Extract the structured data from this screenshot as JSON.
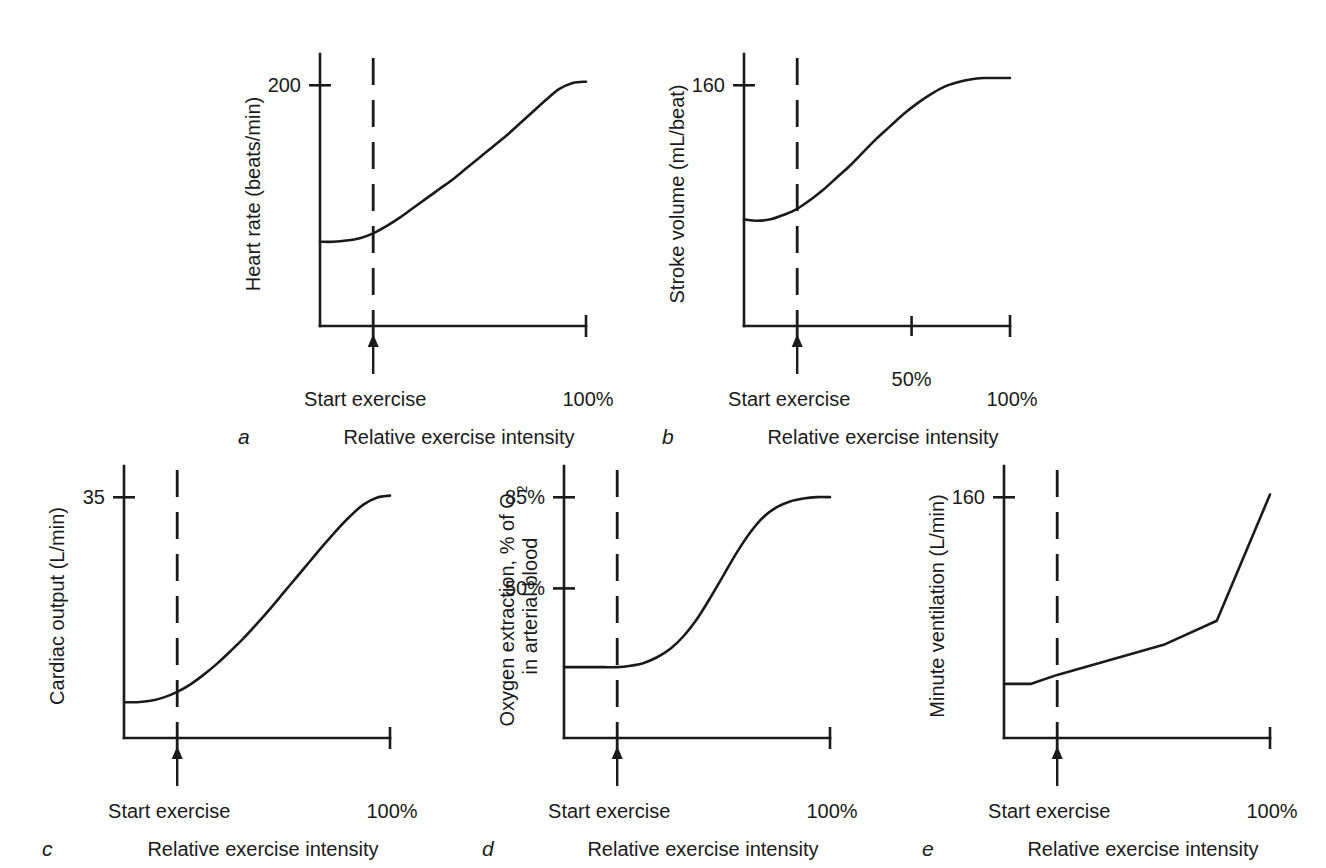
{
  "figure": {
    "background_color": "#ffffff",
    "line_color": "#1a1a1a",
    "common": {
      "xlabel": "Relative exercise intensity",
      "start_marker_label": "Start exercise",
      "x_end_label": "100%"
    }
  },
  "chart_data": [
    {
      "id": "a",
      "type": "line",
      "panel_letter": "a",
      "title": "",
      "ylabel": "Heart rate (beats/min)",
      "xlabel": "Relative exercise intensity",
      "y_ticks": [
        {
          "label": "200",
          "value": 200,
          "pos": 0.885
        }
      ],
      "x_ticks": [
        {
          "label": "100%",
          "value": 100,
          "pos": 1.0
        }
      ],
      "x_mid_ticks": [],
      "annotations": [
        {
          "label": "Start exercise",
          "type": "arrow-up",
          "x_pos": 0.2
        },
        {
          "label": "start-dashed-line",
          "type": "dashed-vertical",
          "x_pos": 0.2
        }
      ],
      "ylim": [
        0,
        226
      ],
      "xlim": [
        0,
        100
      ],
      "grid": false,
      "legend": "none",
      "x": [
        0,
        5,
        10,
        15,
        20,
        25,
        30,
        35,
        40,
        45,
        50,
        55,
        60,
        65,
        70,
        75,
        80,
        85,
        90,
        95,
        100
      ],
      "y": [
        70,
        70,
        71,
        73,
        77,
        83,
        90,
        98,
        106,
        114,
        122,
        131,
        140,
        149,
        158,
        168,
        178,
        188,
        197,
        202,
        203
      ]
    },
    {
      "id": "b",
      "type": "line",
      "panel_letter": "b",
      "title": "",
      "ylabel": "Stroke volume (mL/beat)",
      "xlabel": "Relative exercise intensity",
      "y_ticks": [
        {
          "label": "160",
          "value": 160,
          "pos": 0.885
        }
      ],
      "x_ticks": [
        {
          "label": "100%",
          "value": 100,
          "pos": 1.0
        }
      ],
      "x_mid_ticks": [
        {
          "label": "50%",
          "value": 50,
          "pos": 0.63
        }
      ],
      "annotations": [
        {
          "label": "Start exercise",
          "type": "arrow-up",
          "x_pos": 0.2
        },
        {
          "label": "start-dashed-line",
          "type": "dashed-vertical",
          "x_pos": 0.2
        }
      ],
      "ylim": [
        0,
        181
      ],
      "xlim": [
        0,
        100
      ],
      "grid": false,
      "legend": "none",
      "x": [
        0,
        5,
        10,
        15,
        20,
        25,
        30,
        35,
        40,
        45,
        50,
        55,
        60,
        65,
        70,
        75,
        80,
        85,
        90,
        95,
        100
      ],
      "y": [
        71,
        70,
        71,
        74,
        78,
        84,
        91,
        99,
        107,
        116,
        125,
        133,
        141,
        148,
        154,
        159,
        162,
        164,
        165,
        165,
        165
      ]
    },
    {
      "id": "c",
      "type": "line",
      "panel_letter": "c",
      "title": "",
      "ylabel": "Cardiac output (L/min)",
      "xlabel": "Relative exercise intensity",
      "y_ticks": [
        {
          "label": "35",
          "value": 35,
          "pos": 0.885
        }
      ],
      "x_ticks": [
        {
          "label": "100%",
          "value": 100,
          "pos": 1.0
        }
      ],
      "x_mid_ticks": [],
      "annotations": [
        {
          "label": "Start exercise",
          "type": "arrow-up",
          "x_pos": 0.2
        },
        {
          "label": "start-dashed-line",
          "type": "dashed-vertical",
          "x_pos": 0.2
        }
      ],
      "ylim": [
        0,
        39.5
      ],
      "xlim": [
        0,
        100
      ],
      "grid": false,
      "legend": "none",
      "x": [
        0,
        5,
        10,
        15,
        20,
        25,
        30,
        35,
        40,
        45,
        50,
        55,
        60,
        65,
        70,
        75,
        80,
        85,
        90,
        95,
        100
      ],
      "y": [
        5.2,
        5.2,
        5.4,
        5.9,
        6.7,
        7.8,
        9.2,
        10.8,
        12.6,
        14.5,
        16.6,
        18.8,
        21.1,
        23.4,
        25.7,
        28.0,
        30.2,
        32.2,
        33.9,
        34.9,
        35.2
      ]
    },
    {
      "id": "d",
      "type": "line",
      "panel_letter": "d",
      "title": "",
      "ylabel_line1": "Oxygen extraction, % of O",
      "ylabel_sub": "2",
      "ylabel_line2": "in arterial blood",
      "ylabel": "Oxygen extraction, % of O2 in arterial blood",
      "xlabel": "Relative exercise intensity",
      "y_ticks": [
        {
          "label": "85%",
          "value": 85,
          "pos": 0.885
        },
        {
          "label": "50%",
          "value": 50,
          "pos": 0.55
        }
      ],
      "x_ticks": [
        {
          "label": "100%",
          "value": 100,
          "pos": 1.0
        }
      ],
      "x_mid_ticks": [],
      "annotations": [
        {
          "label": "Start exercise",
          "type": "arrow-up",
          "x_pos": 0.2
        },
        {
          "label": "start-dashed-line",
          "type": "dashed-vertical",
          "x_pos": 0.2
        }
      ],
      "ylim": [
        0,
        96
      ],
      "xlim": [
        0,
        100
      ],
      "grid": false,
      "legend": "none",
      "x": [
        0,
        5,
        10,
        15,
        20,
        25,
        30,
        35,
        40,
        45,
        50,
        55,
        60,
        65,
        70,
        75,
        80,
        85,
        90,
        95,
        100
      ],
      "y": [
        25,
        25,
        25,
        25,
        25,
        25.5,
        26.5,
        28.5,
        31.5,
        36,
        42,
        49.5,
        57.5,
        65.5,
        72.5,
        78,
        81.5,
        83.5,
        84.5,
        85,
        85
      ]
    },
    {
      "id": "e",
      "type": "line",
      "panel_letter": "e",
      "title": "",
      "ylabel": "Minute ventilation (L/min)",
      "xlabel": "Relative exercise intensity",
      "y_ticks": [
        {
          "label": "160",
          "value": 160,
          "pos": 0.885
        }
      ],
      "x_ticks": [
        {
          "label": "100%",
          "value": 100,
          "pos": 1.0
        }
      ],
      "x_mid_ticks": [],
      "annotations": [
        {
          "label": "Start exercise",
          "type": "arrow-up",
          "x_pos": 0.2
        },
        {
          "label": "start-dashed-line",
          "type": "dashed-vertical",
          "x_pos": 0.2
        }
      ],
      "ylim": [
        0,
        181
      ],
      "xlim": [
        0,
        100
      ],
      "grid": false,
      "legend": "none",
      "interpolation": "linear",
      "x": [
        0,
        10,
        20,
        60,
        80,
        100
      ],
      "y": [
        36,
        36,
        42,
        62,
        78,
        162
      ]
    }
  ]
}
